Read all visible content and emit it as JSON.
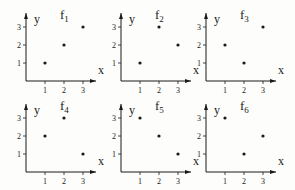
{
  "chart_data": [
    {
      "type": "scatter",
      "title": "f1",
      "xlabel": "x",
      "ylabel": "y",
      "x": [
        1,
        2,
        3
      ],
      "y": [
        1,
        2,
        3
      ],
      "xticks": [
        "1",
        "2",
        "3"
      ],
      "yticks": [
        "1",
        "2",
        "3"
      ],
      "xlim": [
        0,
        3
      ],
      "ylim": [
        0,
        3
      ],
      "grid": false
    },
    {
      "type": "scatter",
      "title": "f2",
      "xlabel": "x",
      "ylabel": "y",
      "x": [
        1,
        2,
        3
      ],
      "y": [
        1,
        3,
        2
      ],
      "xticks": [
        "1",
        "2",
        "3"
      ],
      "yticks": [
        "1",
        "2",
        "3"
      ],
      "xlim": [
        0,
        3
      ],
      "ylim": [
        0,
        3
      ],
      "grid": false
    },
    {
      "type": "scatter",
      "title": "f3",
      "xlabel": "x",
      "ylabel": "y",
      "x": [
        1,
        2,
        3
      ],
      "y": [
        2,
        1,
        3
      ],
      "xticks": [
        "1",
        "2",
        "3"
      ],
      "yticks": [
        "1",
        "2",
        "3"
      ],
      "xlim": [
        0,
        3
      ],
      "ylim": [
        0,
        3
      ],
      "grid": false
    },
    {
      "type": "scatter",
      "title": "f4",
      "xlabel": "x",
      "ylabel": "y",
      "x": [
        1,
        2,
        3
      ],
      "y": [
        2,
        3,
        1
      ],
      "xticks": [
        "1",
        "2",
        "3"
      ],
      "yticks": [
        "1",
        "2",
        "3"
      ],
      "xlim": [
        0,
        3
      ],
      "ylim": [
        0,
        3
      ],
      "grid": false
    },
    {
      "type": "scatter",
      "title": "f5",
      "xlabel": "x",
      "ylabel": "y",
      "x": [
        1,
        2,
        3
      ],
      "y": [
        3,
        2,
        1
      ],
      "xticks": [
        "1",
        "2",
        "3"
      ],
      "yticks": [
        "1",
        "2",
        "3"
      ],
      "xlim": [
        0,
        3
      ],
      "ylim": [
        0,
        3
      ],
      "grid": false
    },
    {
      "type": "scatter",
      "title": "f6",
      "xlabel": "x",
      "ylabel": "y",
      "x": [
        1,
        2,
        3
      ],
      "y": [
        3,
        1,
        2
      ],
      "xticks": [
        "1",
        "2",
        "3"
      ],
      "yticks": [
        "1",
        "2",
        "3"
      ],
      "xlim": [
        0,
        3
      ],
      "ylim": [
        0,
        3
      ],
      "grid": false
    }
  ],
  "panels": [
    {
      "name": "f",
      "sub": "1"
    },
    {
      "name": "f",
      "sub": "2"
    },
    {
      "name": "f",
      "sub": "3"
    },
    {
      "name": "f",
      "sub": "4"
    },
    {
      "name": "f",
      "sub": "5"
    },
    {
      "name": "f",
      "sub": "6"
    }
  ],
  "colors": {
    "ink": "#1a1a1a",
    "background": "#fdfdfb"
  }
}
